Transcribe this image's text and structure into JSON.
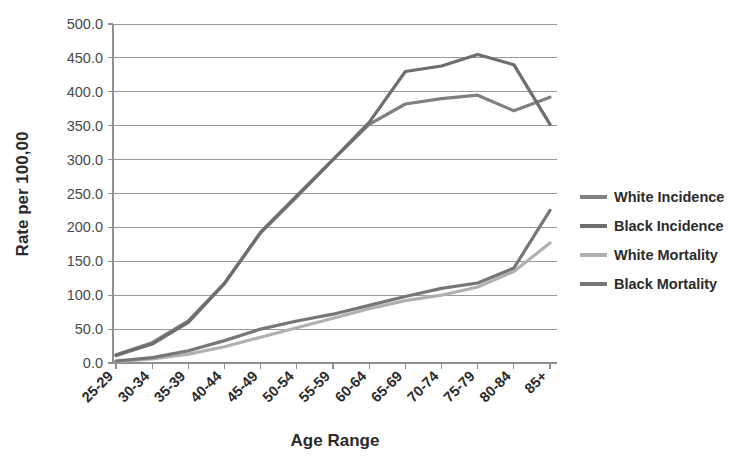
{
  "chart_data": {
    "type": "line",
    "title": "",
    "xlabel": "Age Range",
    "ylabel": "Rate per 100,00",
    "categories": [
      "25-29",
      "30-34",
      "35-39",
      "40-44",
      "45-49",
      "50-54",
      "55-59",
      "60-64",
      "65-69",
      "70-74",
      "75-79",
      "80-84",
      "85+"
    ],
    "ylim": [
      0,
      500
    ],
    "ytick_step": 50,
    "yticks": [
      "0.0",
      "50.0",
      "100.0",
      "150.0",
      "200.0",
      "250.0",
      "300.0",
      "350.0",
      "400.0",
      "450.0",
      "500.0"
    ],
    "grid": true,
    "legend_position": "right",
    "series": [
      {
        "name": "White Incidence",
        "color": "#808080",
        "values": [
          12,
          30,
          62,
          118,
          192,
          245,
          300,
          352,
          382,
          390,
          395,
          372,
          392
        ]
      },
      {
        "name": "Black Incidence",
        "color": "#6e6e6e",
        "values": [
          11,
          28,
          60,
          117,
          193,
          247,
          300,
          355,
          430,
          438,
          455,
          440,
          352
        ]
      },
      {
        "name": "White Mortality",
        "color": "#b0b0b0",
        "values": [
          2,
          6,
          13,
          24,
          38,
          52,
          66,
          80,
          92,
          100,
          112,
          135,
          177
        ]
      },
      {
        "name": "Black Mortality",
        "color": "#767676",
        "values": [
          3,
          8,
          18,
          33,
          50,
          62,
          72,
          85,
          98,
          110,
          118,
          140,
          225
        ]
      }
    ]
  },
  "axes": {
    "y_axis_label": "Rate per 100,00",
    "x_axis_label": "Age Range"
  }
}
